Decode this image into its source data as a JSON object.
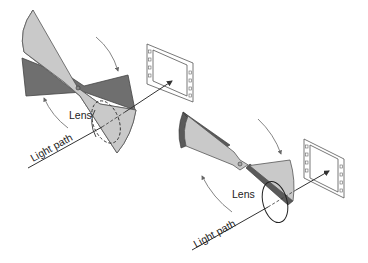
{
  "diagram": {
    "panels": [
      {
        "id": "open",
        "description": "Shutter blade rotated clear of lens; light passes to film",
        "labels": {
          "lens": "Lens",
          "light_path": "Light path"
        }
      },
      {
        "id": "closed",
        "description": "Shutter blade edge-on, blocking lens",
        "labels": {
          "lens": "Lens",
          "light_path": "Light path"
        }
      }
    ],
    "colors": {
      "blade_light": "#c9c9c9",
      "blade_dark": "#6f6f6f",
      "outline": "#444444",
      "background": "#ffffff"
    }
  }
}
